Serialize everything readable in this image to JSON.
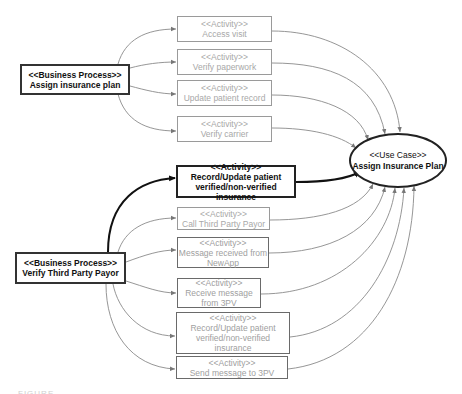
{
  "diagram": {
    "business_processes": [
      {
        "id": "bp1",
        "stereotype": "<<Business Process>>",
        "name": "Assign insurance plan"
      },
      {
        "id": "bp2",
        "stereotype": "<<Business Process>>",
        "name": "Verify Third Party Payor"
      }
    ],
    "activities": [
      {
        "id": "a1",
        "stereotype": "<<Activity>>",
        "lines": [
          "Access visit"
        ],
        "style": "gray",
        "parent": "bp1"
      },
      {
        "id": "a2",
        "stereotype": "<<Activity>>",
        "lines": [
          "Verify paperwork"
        ],
        "style": "gray",
        "parent": "bp1"
      },
      {
        "id": "a3",
        "stereotype": "<<Activity>>",
        "lines": [
          "Update patient record"
        ],
        "style": "gray",
        "parent": "bp1"
      },
      {
        "id": "a4",
        "stereotype": "<<Activity>>",
        "lines": [
          "Verify carrier"
        ],
        "style": "gray",
        "parent": "bp1"
      },
      {
        "id": "a5",
        "stereotype": "<<Activity>>",
        "lines": [
          "Record/Update patient",
          "verified/non-verified insurance"
        ],
        "style": "dark",
        "parent": "bp2"
      },
      {
        "id": "a6",
        "stereotype": "<<Activity>>",
        "lines": [
          "Call Third Party Payor"
        ],
        "style": "gray",
        "parent": "bp2"
      },
      {
        "id": "a7",
        "stereotype": "<<Activity>>",
        "lines": [
          "Message received from",
          "NewApp"
        ],
        "style": "mid",
        "parent": "bp2"
      },
      {
        "id": "a8",
        "stereotype": "<<Activity>>",
        "lines": [
          "Receive message",
          "from 3PV"
        ],
        "style": "mid",
        "parent": "bp2"
      },
      {
        "id": "a9",
        "stereotype": "<<Activity>>",
        "lines": [
          "Record/Update patient",
          "verified/non-verified",
          "insurance"
        ],
        "style": "mid",
        "parent": "bp2"
      },
      {
        "id": "a10",
        "stereotype": "<<Activity>>",
        "lines": [
          "Send message to 3PV"
        ],
        "style": "mid",
        "parent": "bp2"
      }
    ],
    "use_case": {
      "stereotype": "<<Use Case>>",
      "name": "Assign Insurance Plan"
    },
    "caption": "FIGURE"
  },
  "colors": {
    "dark_line": "#111111",
    "gray_line": "#8a8a8a",
    "gray_text": "#a8a8a8",
    "background": "#ffffff"
  }
}
